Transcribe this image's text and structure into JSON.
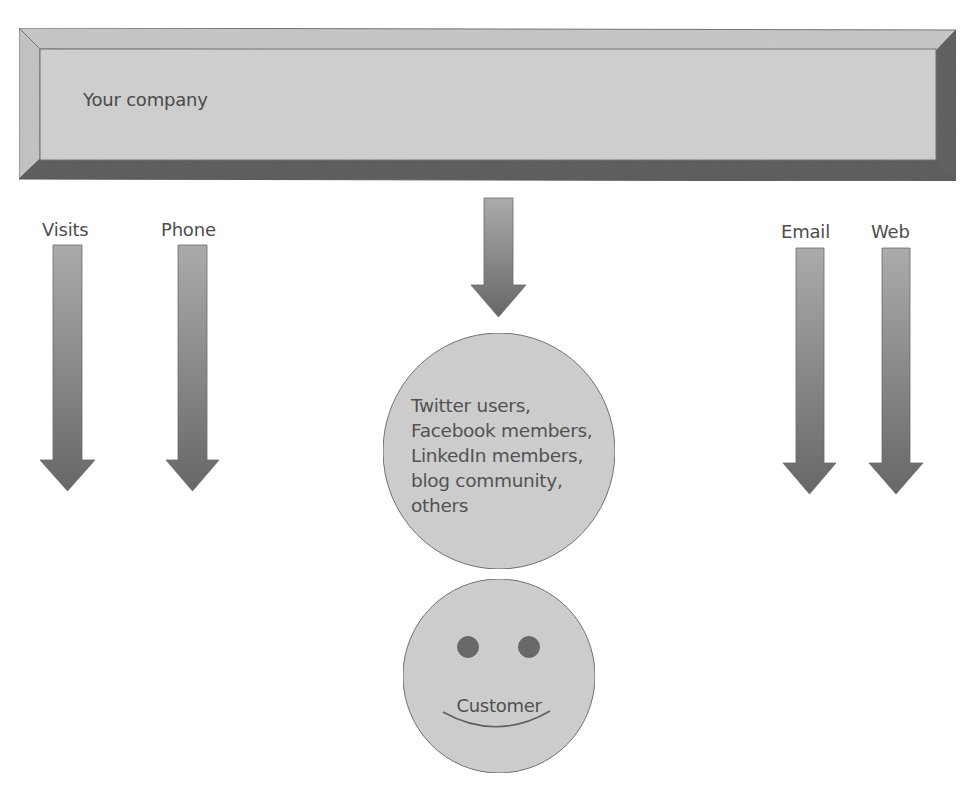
{
  "company": {
    "label": "Your company"
  },
  "channels": [
    {
      "label": "Visits"
    },
    {
      "label": "Phone"
    },
    {
      "label": "Email"
    },
    {
      "label": "Web"
    }
  ],
  "community": {
    "lines": [
      "Twitter users,",
      "Facebook members,",
      "LinkedIn members,",
      "blog community,",
      "others"
    ]
  },
  "customer": {
    "label": "Customer"
  },
  "colors": {
    "bevel_face": "#cfcfcf",
    "bevel_top": "#c6c6c6",
    "bevel_left": "#c2c2c2",
    "bevel_right": "#5c5c5c",
    "bevel_bottom": "#595959",
    "arrow_top": "#ababab",
    "arrow_bottom": "#676767",
    "circle_fill": "#cdcdcd",
    "eye_fill": "#696969",
    "outline": "#6e6e6e"
  }
}
